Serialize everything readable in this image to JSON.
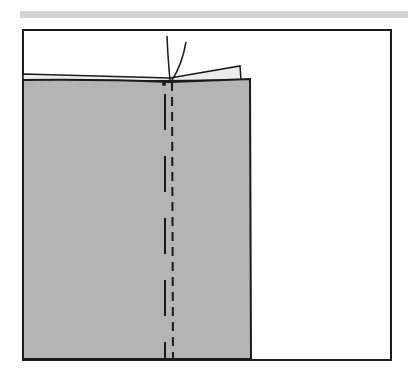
{
  "figure": {
    "colors": {
      "fabric": "#b4b4b4",
      "fabric_under": "#ececec",
      "line": "#1a1a1a",
      "header_bar": "#d4d4d4",
      "background": "#ffffff"
    }
  }
}
